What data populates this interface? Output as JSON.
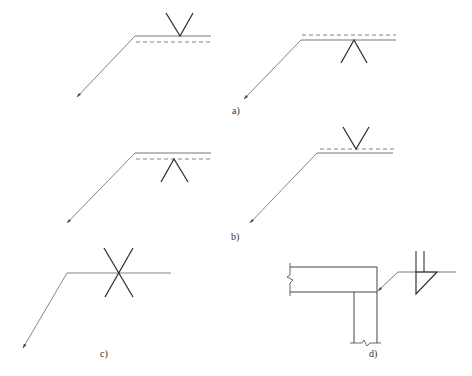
{
  "figure": {
    "caption": "",
    "stroke_color": "#555555",
    "symbol_color": "#333333"
  },
  "panels": [
    {
      "id": "a",
      "label": "a)",
      "description": "Weld symbol V-groove: left shows symbol above reference line (arrow side), right shows symbol below reference line"
    },
    {
      "id": "b",
      "label": "b)",
      "description": "Weld symbol with dashed identification line: left symbol below, right symbol above"
    },
    {
      "id": "c",
      "label": "c)",
      "description": "Double-sided (X) groove weld symbol on reference line"
    },
    {
      "id": "d",
      "label": "d)",
      "description": "T-joint section with fillet weld symbol and field flag"
    }
  ]
}
